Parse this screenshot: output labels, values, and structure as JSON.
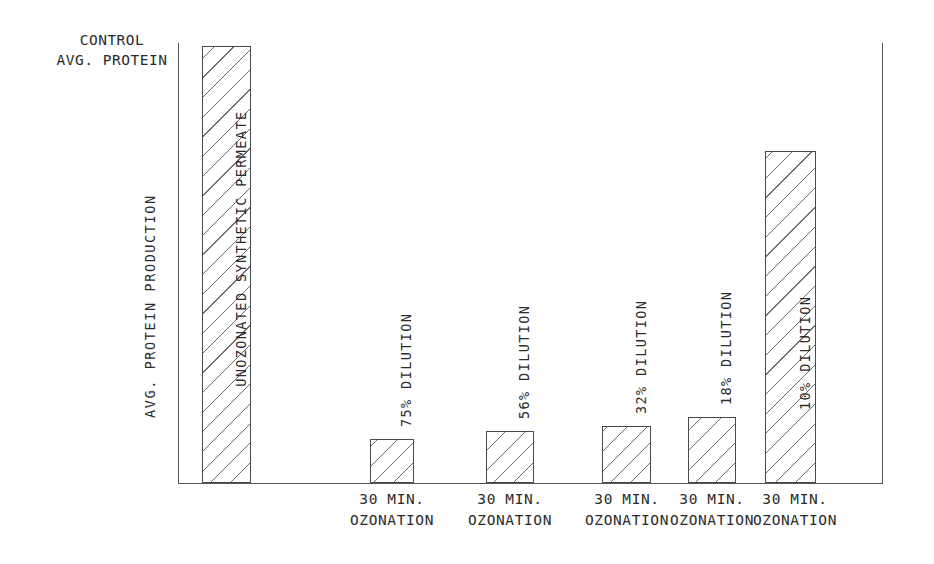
{
  "figure": {
    "control_caption_line1": "CONTROL",
    "control_caption_line2": "AVG. PROTEIN",
    "y_axis_title": "AVG. PROTEIN PRODUCTION"
  },
  "chart_data": {
    "type": "bar",
    "title": "",
    "xlabel": "",
    "ylabel": "AVG. PROTEIN PRODUCTION",
    "grid": false,
    "legend": "none",
    "axis_note_lines": [
      "CONTROL",
      "AVG. PROTEIN"
    ],
    "y_axis_ticks": [],
    "ylim": [
      0,
      100
    ],
    "categories": [
      "UNOZONATED SYNTHETIC PERMEATE",
      "75% DILUTION",
      "56% DILUTION",
      "32% DILUTION",
      "18% DILUTION",
      "10% DILUTION"
    ],
    "values": [
      100,
      10,
      12,
      13,
      15,
      76
    ],
    "bars": [
      {
        "label": "UNOZONATED SYNTHETIC PERMEATE",
        "value": 100,
        "tick_line1": "",
        "tick_line2": "",
        "label_position": "inside"
      },
      {
        "label": "75% DILUTION",
        "value": 10,
        "tick_line1": "30 MIN.",
        "tick_line2": "OZONATION",
        "label_position": "above"
      },
      {
        "label": "56% DILUTION",
        "value": 12,
        "tick_line1": "30 MIN.",
        "tick_line2": "OZONATION",
        "label_position": "above"
      },
      {
        "label": "32% DILUTION",
        "value": 13,
        "tick_line1": "30 MIN.",
        "tick_line2": "OZONATION",
        "label_position": "above"
      },
      {
        "label": "18% DILUTION",
        "value": 15,
        "tick_line1": "30 MIN.",
        "tick_line2": "OZONATION",
        "label_position": "above"
      },
      {
        "label": "10% DILUTION",
        "value": 76,
        "tick_line1": "30 MIN.",
        "tick_line2": "OZONATION",
        "label_position": "inside"
      }
    ]
  }
}
